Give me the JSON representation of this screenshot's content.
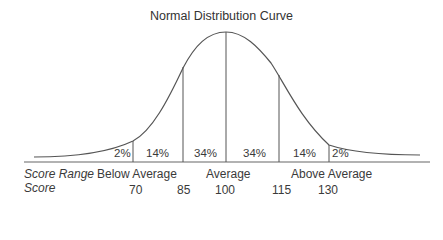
{
  "title": "Normal Distribution Curve",
  "segments": [
    {
      "label": "2%"
    },
    {
      "label": "14%"
    },
    {
      "label": "34%"
    },
    {
      "label": "34%"
    },
    {
      "label": "14%"
    },
    {
      "label": "2%"
    }
  ],
  "rows": {
    "score_range": {
      "header": "Score Range",
      "below": "Below Average",
      "average": "Average",
      "above": "Above Average"
    },
    "score": {
      "header": "Score",
      "values": [
        "70",
        "85",
        "100",
        "115",
        "130"
      ]
    }
  },
  "colors": {
    "line": "#555555",
    "text": "#3a3a3a"
  }
}
